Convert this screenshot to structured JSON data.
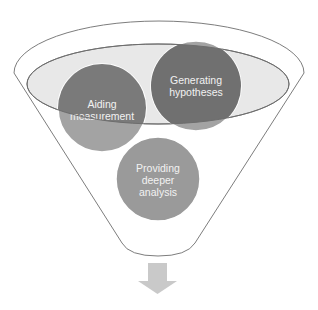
{
  "diagram": {
    "type": "funnel",
    "items": [
      {
        "id": "aiding",
        "lines": [
          "Aiding",
          "measurement"
        ],
        "color": "#7a7a7a"
      },
      {
        "id": "generating",
        "lines": [
          "Generating",
          "hypotheses"
        ],
        "color": "#707070"
      },
      {
        "id": "providing",
        "lines": [
          "Providing",
          "deeper",
          "analysis"
        ],
        "color": "#9a9a9a"
      }
    ],
    "colors": {
      "funnel_stroke": "#7d7d7d",
      "funnel_top_fill": "#e8e8e8",
      "arrow": "#c9c9c9"
    },
    "output_arrow": "down-arrow"
  }
}
